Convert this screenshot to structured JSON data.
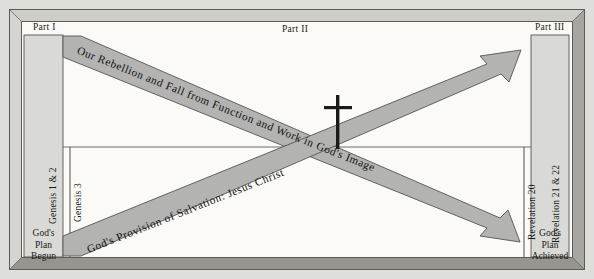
{
  "diagram": {
    "title_parts": {
      "part_one": "Part I",
      "part_two": "Part II",
      "part_three": "Part III"
    },
    "left_column": {
      "scripture_label": "Genesis 1 & 2",
      "caption_line1": "God's",
      "caption_line2": "Plan",
      "caption_line3": "Begun"
    },
    "left_divider": {
      "scripture_label": "Genesis 3"
    },
    "right_divider": {
      "scripture_label": "Revelation 20"
    },
    "right_column": {
      "scripture_label": "Revelation 21 & 22",
      "caption_line1": "God's",
      "caption_line2": "Plan",
      "caption_line3": "Achieved"
    },
    "arrows": {
      "descending_label": "Our Rebellion and Fall from Function and Work in God's Image",
      "ascending_label": "God's Provision of Salvation: Jesus Christ"
    },
    "symbols": {
      "cross": "christian-cross"
    },
    "colors": {
      "page_background": "#dededa",
      "canvas_background": "#fbfaf6",
      "frame_light": "#d4d2cc",
      "frame_mid": "#b8b6b0",
      "frame_dark": "#8f8d88",
      "frame_darkest": "#6e6c68",
      "column_fill": "#d9d9d6",
      "ribbon_fill": "#b3b3b1",
      "ribbon_stroke": "#555553",
      "rule_line": "#6d6d6b",
      "cross_color": "#1a1a1a"
    }
  }
}
